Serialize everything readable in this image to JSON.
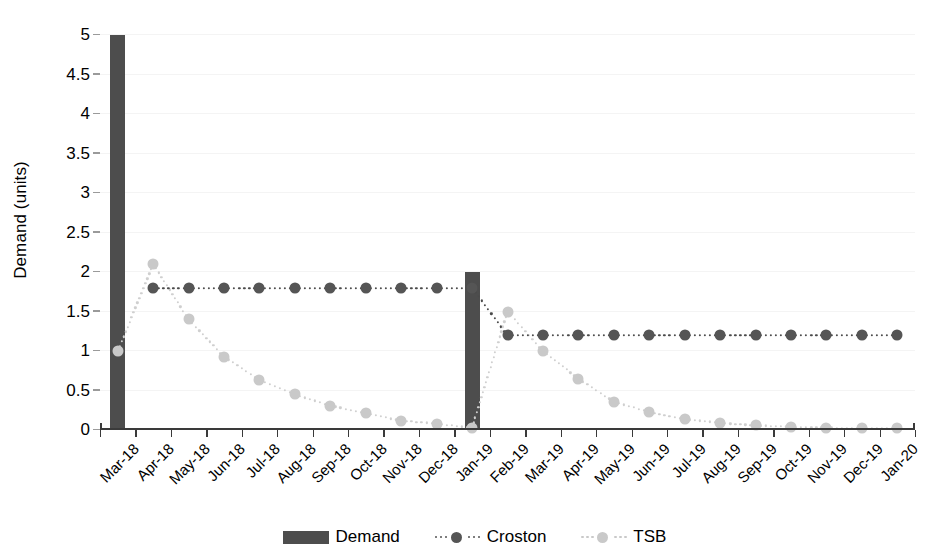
{
  "chart_data": {
    "type": "bar",
    "title": "",
    "xlabel": "",
    "ylabel": "Demand (units)",
    "ylim": [
      0,
      5
    ],
    "ytick_step": 0.5,
    "grid": true,
    "legend_position": "bottom",
    "categories": [
      "Mar-18",
      "Apr-18",
      "May-18",
      "Jun-18",
      "Jul-18",
      "Aug-18",
      "Sep-18",
      "Oct-18",
      "Nov-18",
      "Dec-18",
      "Jan-19",
      "Feb-19",
      "Mar-19",
      "Apr-19",
      "May-19",
      "Jun-19",
      "Jul-19",
      "Aug-19",
      "Sep-19",
      "Oct-19",
      "Nov-19",
      "Dec-19",
      "Jan-20"
    ],
    "ytick_labels": [
      "0",
      "0.5",
      "1",
      "1.5",
      "2",
      "2.5",
      "3",
      "3.5",
      "4",
      "4.5",
      "5"
    ],
    "ytick_values": [
      0,
      0.5,
      1,
      1.5,
      2,
      2.5,
      3,
      3.5,
      4,
      4.5,
      5
    ],
    "series": [
      {
        "name": "Demand",
        "type": "bar",
        "color": "#4d4d4d",
        "values": [
          5,
          0,
          0,
          0,
          0,
          0,
          0,
          0,
          0,
          0,
          2,
          0,
          0,
          0,
          0,
          0,
          0,
          0,
          0,
          0,
          0,
          0,
          0
        ]
      },
      {
        "name": "Croston",
        "type": "line",
        "color": "#555555",
        "style": "dotted",
        "marker": "circle",
        "values": [
          null,
          1.8,
          1.8,
          1.8,
          1.8,
          1.8,
          1.8,
          1.8,
          1.8,
          1.8,
          1.8,
          1.2,
          1.2,
          1.2,
          1.2,
          1.2,
          1.2,
          1.2,
          1.2,
          1.2,
          1.2,
          1.2,
          1.2
        ]
      },
      {
        "name": "TSB",
        "type": "line",
        "color": "#c9c9c9",
        "style": "dotted",
        "marker": "circle",
        "values": [
          1.0,
          2.1,
          1.4,
          0.93,
          0.63,
          0.45,
          0.31,
          0.21,
          0.12,
          0.08,
          0.03,
          1.5,
          1.0,
          0.65,
          0.36,
          0.23,
          0.14,
          0.09,
          0.06,
          0.04,
          0.03,
          0.02,
          0.02
        ]
      }
    ]
  },
  "legend": {
    "items": [
      {
        "label": "Demand",
        "kind": "bar",
        "color": "#4d4d4d"
      },
      {
        "label": "Croston",
        "kind": "line",
        "color": "#555555"
      },
      {
        "label": "TSB",
        "kind": "line",
        "color": "#c9c9c9"
      }
    ]
  }
}
